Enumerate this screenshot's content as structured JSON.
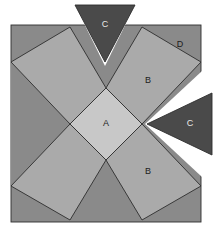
{
  "figure": {
    "canvas": {
      "width": 220,
      "height": 232,
      "background": "#ffffff"
    },
    "square": {
      "left": 11,
      "top": 25,
      "right": 201,
      "bottom": 222
    },
    "palette": {
      "background_d": "#8a8a8a",
      "piece_b": "#aaaaaa",
      "piece_a": "#c8c8c8",
      "piece_c": "#4a4a4a",
      "outline": "#2e2e2e",
      "gap": "#ffffff"
    },
    "labels": {
      "a": "A",
      "b_upper": "B",
      "b_lower": "B",
      "c_top": "C",
      "c_right": "C",
      "d": "D"
    },
    "label_positions": {
      "a": {
        "x": 106,
        "y": 124
      },
      "b_upper": {
        "x": 148,
        "y": 81
      },
      "b_lower": {
        "x": 148,
        "y": 172
      },
      "c_top": {
        "x": 105,
        "y": 25
      },
      "c_right": {
        "x": 190,
        "y": 124
      },
      "d": {
        "x": 180,
        "y": 45
      }
    },
    "pieces": {
      "center_diamond_a": "106,88 142,124 106,160 70,124",
      "kite_b_upper_right": "106,88 142,124 201,62 142,27",
      "kite_b_lower_right": "106,160 142,124 201,186 142,220",
      "kite_b_upper_left": "106,88 70,124 11,62 70,27",
      "kite_b_lower_left": "106,160 70,124 11,186 70,220",
      "wedge_top_center": "106,88 70,27 142,27",
      "wedge_bottom_center": "106,160 70,220 142,220",
      "wedge_left_center": "70,124 11,62 11,186",
      "corner_d_top_right": "142,27 201,27 201,62",
      "corner_d_bottom_right": "142,220 201,220 201,186",
      "corner_d_top_left": "70,27 11,27 11,62",
      "corner_d_bottom_left": "70,220 11,220 11,186",
      "triangle_c_top": "75,5 135,5 105,62",
      "triangle_c_right": "212,93 212,155 147,124",
      "gap_notch_top": "70,27 106,88 142,27 137,1 105,66 73,1",
      "gap_notch_right": "201,62 142,124 201,186 216,190 145,124 216,58"
    }
  }
}
